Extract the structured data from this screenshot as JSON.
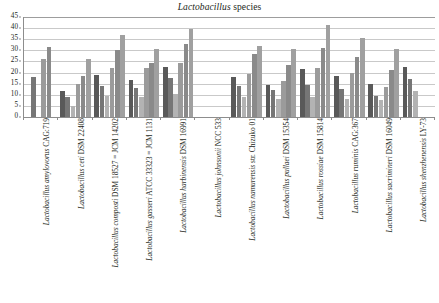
{
  "chart_data": {
    "type": "bar",
    "title": "Lactobacillus species",
    "title_italic_part": "Lactobacillus",
    "title_roman_part": " species",
    "xlabel": "",
    "ylabel": "",
    "ylim": [
      0,
      45
    ],
    "ytick_step": 5,
    "yticks": [
      0,
      5,
      10,
      15,
      20,
      25,
      30,
      35,
      40,
      45
    ],
    "ytick_labels": [
      "0",
      "5",
      "10",
      "15",
      "20",
      "25",
      "30",
      "35",
      "40",
      "45"
    ],
    "grid": true,
    "grid_axis": "y",
    "legend": "none",
    "bars_per_group": 6,
    "orientation": "vertical",
    "categories": [
      "Lactobacillus amylovorus CAG:719",
      "Lactobacillus ceti DSM 22408",
      "Lactobacillus composti DSM 18527 = JCM 14202",
      "Lactobacillus gasseri ATCC 33323 = JCM 1131",
      "Lactobacillus harbinensis DSM 16991",
      "Lactobacillus johnsonii NCC 533",
      "Lactobacillus namurensis str. Chizuko 01",
      "Lactobacillus pullaei DSM 15354",
      "Lactobacillus rossiae DSM 15814",
      "Lactobacillus ruminis CAG:367",
      "Lactobacillus sacrimineri DSM 16049",
      "Lactobacillus shenzhenensis LY-73"
    ],
    "category_label_parts": [
      {
        "italic": "Lactobacillus amylovorus",
        "roman": " CAG:719"
      },
      {
        "italic": "Lactobacillus ceti",
        "roman": " DSM 22408"
      },
      {
        "italic": "Lactobacillus composti",
        "roman": " DSM 18527 = JCM 14202"
      },
      {
        "italic": "Lactobacillus gasseri",
        "roman": " ATCC 33323 = JCM 1131"
      },
      {
        "italic": "Lactobacillus harbinensis",
        "roman": " DSM 16991"
      },
      {
        "italic": "Lactobacillus johnsonii",
        "roman": " NCC 533"
      },
      {
        "italic": "Lactobacillus namurensis",
        "roman": " str. Chizuko 01"
      },
      {
        "italic": "Lactobacillus pullaei",
        "roman": " DSM 15354"
      },
      {
        "italic": "Lactobacillus rossiae",
        "roman": " DSM 15814"
      },
      {
        "italic": "Lactobacillus ruminis",
        "roman": " CAG:367"
      },
      {
        "italic": "Lactobacillus sacrimineri",
        "roman": " DSM 16049"
      },
      {
        "italic": "Lactobacillus shenzhenensis",
        "roman": " LY-73"
      }
    ],
    "series": [
      {
        "name": "series-1",
        "color": "#595959",
        "values": [
          null,
          11.5,
          19.0,
          16.5,
          22.5,
          0,
          18.0,
          14.5,
          21.5,
          18.5,
          15.0,
          22.5
        ]
      },
      {
        "name": "series-2",
        "color": "#767676",
        "values": [
          18.0,
          9.0,
          14.0,
          13.0,
          17.5,
          0,
          14.0,
          12.0,
          14.5,
          12.5,
          9.5,
          17.0
        ]
      },
      {
        "name": "series-3",
        "color": "#b3b3b3",
        "values": [
          null,
          5.0,
          9.5,
          9.0,
          10.5,
          0,
          9.0,
          8.0,
          9.0,
          8.0,
          7.5,
          11.5
        ]
      },
      {
        "name": "series-4",
        "color": "#9b9b9b",
        "values": [
          26.0,
          15.0,
          22.0,
          22.0,
          24.5,
          0,
          19.5,
          16.0,
          22.0,
          20.0,
          13.5,
          null
        ]
      },
      {
        "name": "series-5",
        "color": "#8a8a8a",
        "values": [
          31.5,
          18.5,
          30.0,
          24.5,
          33.0,
          0,
          28.5,
          23.5,
          31.0,
          27.0,
          21.0,
          null
        ]
      },
      {
        "name": "series-6",
        "color": "#a0a0a0",
        "values": [
          null,
          26.0,
          37.0,
          30.5,
          39.5,
          0,
          32.0,
          30.5,
          41.5,
          35.5,
          30.5,
          null
        ]
      }
    ]
  }
}
